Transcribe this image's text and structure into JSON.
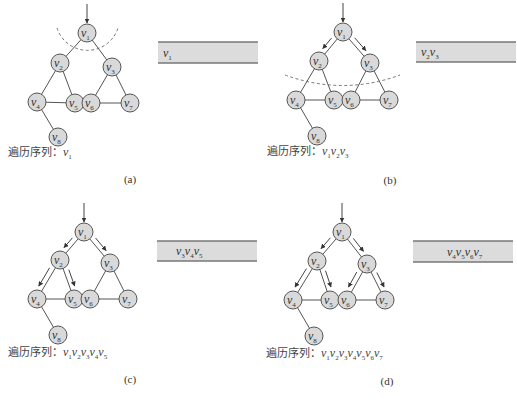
{
  "figure": {
    "node_labels": [
      "v1",
      "v2",
      "v3",
      "v4",
      "v5",
      "v6",
      "v7",
      "v8"
    ],
    "edges": [
      [
        1,
        2
      ],
      [
        1,
        3
      ],
      [
        2,
        4
      ],
      [
        2,
        5
      ],
      [
        3,
        6
      ],
      [
        3,
        7
      ],
      [
        4,
        5
      ],
      [
        6,
        7
      ],
      [
        4,
        8
      ]
    ],
    "colors": {
      "node_fill": "#d9d9d9",
      "node_stroke": "#555555",
      "bar_fill": "#dcdcdc",
      "bar_border": "#777777"
    },
    "panels": [
      {
        "id": "a",
        "caption": "(a)",
        "sequence_label": "遍历序列：",
        "sequence": [
          "v1"
        ],
        "queue": [
          "v1"
        ],
        "arrows": [],
        "dashed_arc": "around v1"
      },
      {
        "id": "b",
        "caption": "(b)",
        "sequence_label": "遍历序列：",
        "sequence": [
          "v1",
          "v2",
          "v3"
        ],
        "queue": [
          "v2",
          "v3"
        ],
        "arrows": [
          [
            1,
            2
          ],
          [
            1,
            3
          ]
        ],
        "dashed_arc": "below v2, v3"
      },
      {
        "id": "c",
        "caption": "(c)",
        "sequence_label": "遍历序列：",
        "sequence": [
          "v1",
          "v2",
          "v3",
          "v4",
          "v5"
        ],
        "queue": [
          "v3",
          "v4",
          "v5"
        ],
        "arrows": [
          [
            1,
            2
          ],
          [
            1,
            3
          ],
          [
            2,
            4
          ],
          [
            2,
            5
          ]
        ]
      },
      {
        "id": "d",
        "caption": "(d)",
        "sequence_label": "遍历序列：",
        "sequence": [
          "v1",
          "v2",
          "v3",
          "v4",
          "v5",
          "v6",
          "v7"
        ],
        "queue": [
          "v4",
          "v5",
          "v6",
          "v7"
        ],
        "arrows": [
          [
            1,
            2
          ],
          [
            1,
            3
          ],
          [
            2,
            4
          ],
          [
            2,
            5
          ],
          [
            3,
            6
          ],
          [
            3,
            7
          ]
        ]
      }
    ]
  }
}
